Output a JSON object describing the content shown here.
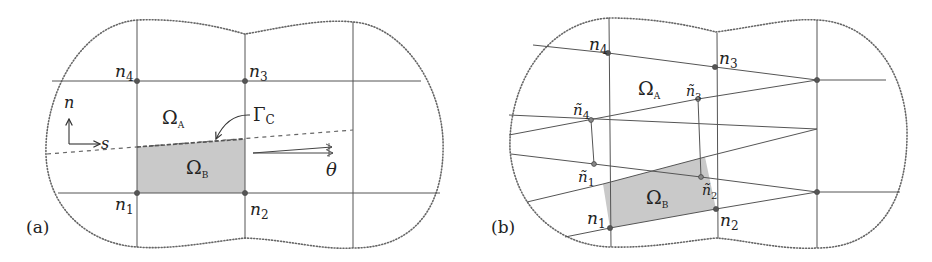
{
  "figure": {
    "panels": [
      {
        "id": "a",
        "label": "(a)",
        "nodes": [
          {
            "name": "n",
            "sub": "4"
          },
          {
            "name": "n",
            "sub": "3"
          },
          {
            "name": "n",
            "sub": "1"
          },
          {
            "name": "n",
            "sub": "2"
          }
        ],
        "regions": [
          {
            "symbol": "Ω",
            "sub": "A"
          },
          {
            "symbol": "Ω",
            "sub": "B"
          }
        ],
        "interface": {
          "symbol": "Γ",
          "sub": "C"
        },
        "axes": {
          "normal": "n",
          "tangent": "s"
        },
        "angle": "θ"
      },
      {
        "id": "b",
        "label": "(b)",
        "nodes": [
          {
            "name": "n",
            "sub": "4"
          },
          {
            "name": "n",
            "sub": "3"
          },
          {
            "name": "n",
            "sub": "1"
          },
          {
            "name": "n",
            "sub": "2"
          }
        ],
        "tilde_nodes": [
          {
            "name": "ñ",
            "sub": "4"
          },
          {
            "name": "ñ",
            "sub": "3"
          },
          {
            "name": "ñ",
            "sub": "1"
          },
          {
            "name": "ñ",
            "sub": "2"
          }
        ],
        "regions": [
          {
            "symbol": "Ω",
            "sub": "A"
          },
          {
            "symbol": "Ω",
            "sub": "B"
          }
        ]
      }
    ],
    "colors": {
      "shade": "#c9c9c9",
      "lines": "#555555",
      "text": "#222222"
    }
  }
}
